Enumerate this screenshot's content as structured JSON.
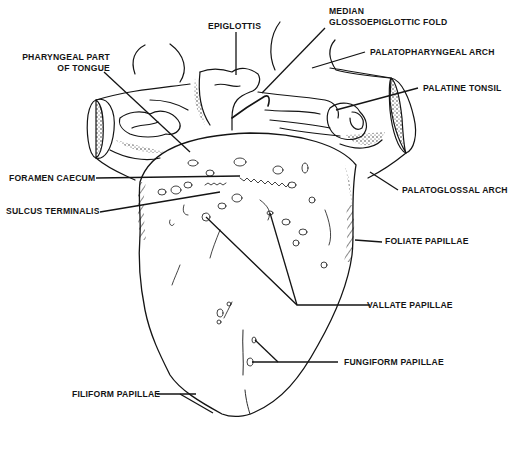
{
  "diagram": {
    "colors": {
      "ink": "#141414",
      "background": "#ffffff"
    },
    "labels": {
      "epiglottis": "EPIGLOTTIS",
      "median_fold_line1": "MEDIAN",
      "median_fold_line2": "GLOSSOEPIGLOTTIC FOLD",
      "palatopharyngeal_arch": "PALATOPHARYNGEAL ARCH",
      "pharyngeal_part_line1": "PHARYNGEAL PART",
      "pharyngeal_part_line2": "OF TONGUE",
      "palatine_tonsil": "PALATINE TONSIL",
      "foramen_caecum": "FORAMEN CAECUM",
      "sulcus_terminalis": "SULCUS TERMINALIS",
      "palatoglossal_arch": "PALATOGLOSSAL ARCH",
      "foliate_papillae": "FOLIATE PAPILLAE",
      "vallate_papillae": "VALLATE PAPILLAE",
      "fungiform_papillae": "FUNGIFORM PAPILLAE",
      "filiform_papillae": "FILIFORM PAPILLAE"
    }
  }
}
